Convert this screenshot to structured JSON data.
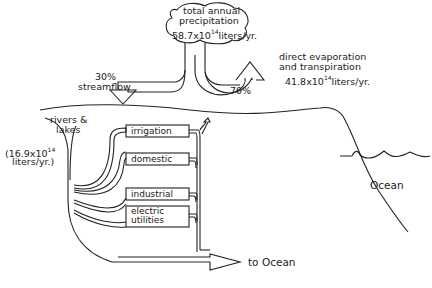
{
  "precipitation": {
    "line1": "total annual",
    "line2": "precipitation",
    "value_base": "58.7x10",
    "value_exp": "14",
    "value_unit": "liters/yr."
  },
  "evaporation": {
    "line1": "direct evaporation",
    "line2": "and transpiration",
    "value_base": "41.8x10",
    "value_exp": "14",
    "value_unit": "liters/yr.",
    "percent": "70%"
  },
  "streamflow": {
    "percent": "30%",
    "label": "streamflow"
  },
  "rivers": {
    "line1": "rivers &",
    "line2": "lakes",
    "value_line1_base": "(16.9x10",
    "value_line1_exp": "14",
    "value_line2": "liters/yr.)"
  },
  "uses": [
    {
      "label": "irrigation"
    },
    {
      "label": "domestic"
    },
    {
      "label": "industrial"
    },
    {
      "label_line1": "electric",
      "label_line2": "utilities"
    }
  ],
  "outflow": {
    "label": "to Ocean"
  },
  "ocean": {
    "label": "Ocean"
  },
  "colors": {
    "ink": "#222222",
    "background": "#ffffff"
  }
}
